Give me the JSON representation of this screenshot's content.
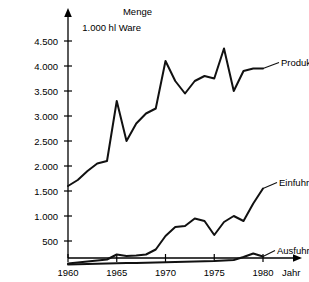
{
  "chart_data": {
    "type": "line",
    "title": "",
    "ylabel": "Menge",
    "ylabel_unit": "1.000 hl Ware",
    "xlabel": "Jahr",
    "grid": false,
    "legend_position": "inline-right-of-series",
    "xlim": [
      1960,
      1981
    ],
    "ylim": [
      0,
      4750
    ],
    "ytick_labels": [
      "500",
      "1.000",
      "1.500",
      "2.000",
      "2.500",
      "3.000",
      "3.500",
      "4.000",
      "4.500"
    ],
    "ytick_values": [
      500,
      1000,
      1500,
      2000,
      2500,
      3000,
      3500,
      4000,
      4500
    ],
    "xtick_labels": [
      "1960",
      "1965",
      "1970",
      "1975",
      "1980"
    ],
    "xtick_values": [
      1960,
      1965,
      1970,
      1975,
      1980
    ],
    "x": [
      1960,
      1961,
      1962,
      1963,
      1964,
      1965,
      1966,
      1967,
      1968,
      1969,
      1970,
      1971,
      1972,
      1973,
      1974,
      1975,
      1976,
      1977,
      1978,
      1979,
      1980
    ],
    "series": [
      {
        "name": "Produktion",
        "values": [
          1600,
          1720,
          1900,
          2050,
          2100,
          3300,
          2500,
          2850,
          3050,
          3150,
          4100,
          3700,
          3450,
          3700,
          3800,
          3750,
          4350,
          3500,
          3900,
          3950,
          3950
        ],
        "label": "Produktion",
        "color": "#111111"
      },
      {
        "name": "Einfuhr",
        "values": [
          50,
          70,
          90,
          110,
          130,
          230,
          200,
          210,
          230,
          330,
          600,
          780,
          800,
          950,
          900,
          620,
          880,
          1000,
          900,
          1250,
          1550
        ],
        "label": "Einfuhr",
        "color": "#111111"
      },
      {
        "name": "Ausfuhr",
        "values": [
          30,
          35,
          40,
          45,
          50,
          55,
          60,
          60,
          65,
          70,
          75,
          80,
          85,
          90,
          95,
          100,
          110,
          120,
          180,
          250,
          190
        ],
        "label": "Ausfuhr",
        "color": "#111111"
      }
    ]
  },
  "labels": {
    "y_axis_title": "Menge",
    "y_axis_unit": "1.000 hl Ware",
    "x_axis_title": "Jahr",
    "produktion": "Produktion",
    "einfuhr": "Einfuhr",
    "ausfuhr": "Ausfuhr"
  }
}
